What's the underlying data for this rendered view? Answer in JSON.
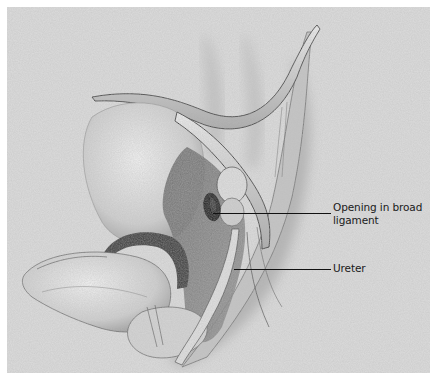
{
  "figure": {
    "type": "anatomical-illustration",
    "style": "grayscale pencil rendering"
  },
  "labels": [
    {
      "id": "opening-broad-ligament",
      "lines": [
        "Opening in broad",
        "ligament"
      ],
      "text": "Opening in broad ligament"
    },
    {
      "id": "ureter",
      "lines": [
        "Ureter"
      ],
      "text": "Ureter"
    }
  ],
  "colors": {
    "background": "#dcdcdc",
    "margin": "#ffffff",
    "ink": "#111111"
  }
}
